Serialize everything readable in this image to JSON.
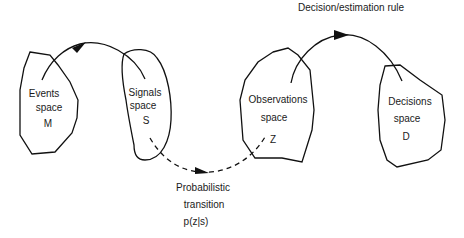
{
  "diagram": {
    "title": "Decision/estimation rule",
    "spaces": [
      {
        "id": "events",
        "name": "Events",
        "word": "space",
        "symbol": "M"
      },
      {
        "id": "signals",
        "name": "Signals",
        "word": "space",
        "symbol": "S"
      },
      {
        "id": "observations",
        "name": "Observations",
        "word": "space",
        "symbol": "Z"
      },
      {
        "id": "decisions",
        "name": "Decisions",
        "word": "space",
        "symbol": "D"
      }
    ],
    "transition": {
      "line1": "Probabilistic",
      "line2": "transition",
      "formula": "p(z|s)"
    },
    "arrows": [
      {
        "from": "events",
        "to": "signals",
        "style": "solid"
      },
      {
        "from": "signals",
        "to": "observations",
        "style": "dashed"
      },
      {
        "from": "observations",
        "to": "decisions",
        "style": "solid"
      }
    ],
    "colors": {
      "stroke": "#111111",
      "background": "#ffffff"
    }
  }
}
